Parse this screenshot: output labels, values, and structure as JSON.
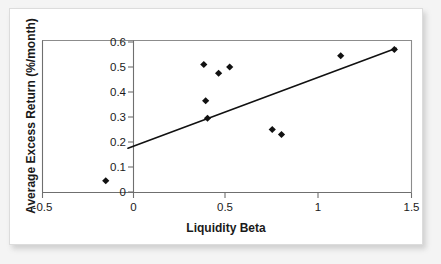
{
  "figure": {
    "background_color": "#f4f4f4",
    "card_color": "#ffffff",
    "card_border_color": "#dcdcdc",
    "marker_color": "#111111",
    "line_color": "#111111",
    "axis_color": "#6f6f6f"
  },
  "chart_data": {
    "type": "scatter",
    "title": "",
    "xlabel": "Liquidity Beta",
    "ylabel": "Average Excess Return (%/month)",
    "xlim": [
      -0.5,
      1.5
    ],
    "ylim": [
      0,
      0.6
    ],
    "grid": false,
    "legend": "none",
    "xticks": [
      -0.5,
      0,
      0.5,
      1,
      1.5
    ],
    "xticklabels": [
      "-0.5",
      "0",
      "0.5",
      "1",
      "1.5"
    ],
    "yticks": [
      0,
      0.1,
      0.2,
      0.3,
      0.4,
      0.5,
      0.6
    ],
    "yticklabels": [
      "0",
      "0.1",
      "0.2",
      "0.3",
      "0.4",
      "0.5",
      "0.6"
    ],
    "series": [
      {
        "name": "Portfolios",
        "marker": "diamond",
        "points": [
          {
            "x": -0.15,
            "y": 0.045
          },
          {
            "x": 0.38,
            "y": 0.51
          },
          {
            "x": 0.39,
            "y": 0.365
          },
          {
            "x": 0.4,
            "y": 0.295
          },
          {
            "x": 0.46,
            "y": 0.475
          },
          {
            "x": 0.52,
            "y": 0.5
          },
          {
            "x": 0.75,
            "y": 0.25
          },
          {
            "x": 0.8,
            "y": 0.23
          },
          {
            "x": 1.12,
            "y": 0.545
          },
          {
            "x": 1.41,
            "y": 0.57
          }
        ]
      }
    ],
    "trendline": {
      "type": "linear-fit",
      "x_start": -0.03,
      "y_start": 0.175,
      "x_end": 1.42,
      "y_end": 0.575
    }
  }
}
